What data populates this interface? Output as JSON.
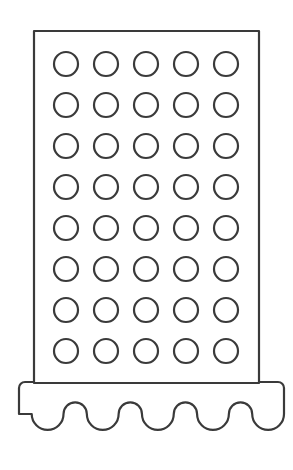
{
  "canvas": {
    "width": 293,
    "height": 470,
    "background_color": "#ffffff",
    "title": "Box grater line drawing"
  },
  "style": {
    "stroke_color": "#3a3a3a",
    "stroke_width": 2.2,
    "fill_color": "#ffffff",
    "line_join": "round",
    "line_cap": "round"
  },
  "artwork": {
    "name": "grater-outline",
    "description": "Line-art outline of a box grater: tall rectangular body with a grid of round holes sitting on a wider base with a scalloped bottom edge.",
    "body": {
      "name": "grater-body",
      "shape": "rectangle",
      "x": 34,
      "y": 31,
      "width": 225,
      "height": 352
    },
    "hole_grid": {
      "name": "grater-hole-grid",
      "rows": 8,
      "columns": 5,
      "total_holes": 40,
      "radius": 12,
      "first_center_x": 66,
      "first_center_y": 64,
      "step_x": 40,
      "step_y": 41
    },
    "base": {
      "name": "grater-base",
      "x": 19,
      "y": 382,
      "width": 265,
      "height": 66,
      "corner_radius": 6,
      "scallops": {
        "name": "base-scalloped-edge",
        "count": 5,
        "trough_depth": 33,
        "baseline_y": 414,
        "start_x": 19,
        "end_x": 284
      }
    }
  }
}
